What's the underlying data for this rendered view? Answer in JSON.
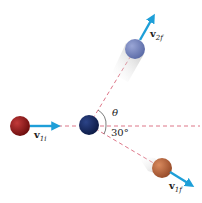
{
  "diagram": {
    "title": "",
    "colors": {
      "background": "#ffffff",
      "vector": "#1e9fd8",
      "guide_line": "#d9667a",
      "ball_incoming": "#8a1414",
      "ball_target": "#14285e",
      "ball_2f": "#7282bb",
      "ball_1f": "#b3603a"
    },
    "balls": [
      {
        "id": "ball-1-initial",
        "cx": 20,
        "cy": 126,
        "r": 10
      },
      {
        "id": "ball-2-initial",
        "cx": 89,
        "cy": 125,
        "r": 10
      },
      {
        "id": "ball-2-final",
        "cx": 135,
        "cy": 49,
        "r": 10
      },
      {
        "id": "ball-1-final",
        "cx": 162,
        "cy": 168,
        "r": 10
      }
    ],
    "vectors": [
      {
        "id": "v1i",
        "label_main": "v",
        "label_sub": "1i",
        "x1": 30,
        "y1": 126,
        "x2": 58,
        "y2": 126
      },
      {
        "id": "v2f",
        "label_main": "v",
        "label_sub": "2f",
        "x1": 140,
        "y1": 40,
        "x2": 155,
        "y2": 14
      },
      {
        "id": "v1f",
        "label_main": "v",
        "label_sub": "1f",
        "x1": 170,
        "y1": 172,
        "x2": 194,
        "y2": 187
      }
    ],
    "angles": [
      {
        "label": "θ",
        "description": "angle between horizontal and v2f direction"
      },
      {
        "label": "30°",
        "description": "angle between horizontal and v1f direction"
      }
    ]
  }
}
